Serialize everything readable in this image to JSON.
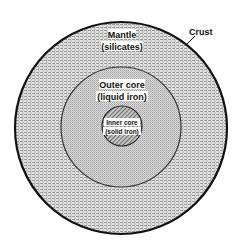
{
  "diagram": {
    "type": "concentric-layers",
    "center": [
      121,
      128
    ],
    "layers": [
      {
        "id": "crust",
        "name": "Crust",
        "radius": 107
      },
      {
        "id": "mantle",
        "name": "Mantle",
        "composition": "(silicates)",
        "radius": 106
      },
      {
        "id": "outer_core",
        "name": "Outer core",
        "composition": "(liquid iron)",
        "radius": 60
      },
      {
        "id": "inner_core",
        "name": "Inner core",
        "composition": "(solid iron)",
        "radius": 20
      }
    ]
  },
  "labels": {
    "crust": "Crust",
    "mantle_name": "Mantle",
    "mantle_comp": "(silicates)",
    "outer_name": "Outer core",
    "outer_comp": "(liquid iron)",
    "inner_name": "Inner core",
    "inner_comp": "(solid iron)"
  }
}
